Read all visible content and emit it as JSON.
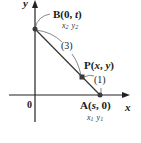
{
  "diagram": {
    "axes": {
      "x_label": "x",
      "y_label": "y",
      "origin_label": "0"
    },
    "points": {
      "B": {
        "name": "B",
        "coords": "(0, t)",
        "x_text": "0",
        "y_text": "t",
        "annotation": "x₂ y₂",
        "ann_x": "x",
        "ann_x_sub": "2",
        "ann_y": "y",
        "ann_y_sub": "2"
      },
      "P": {
        "name": "P",
        "coords": "(x, y)",
        "x_text": "x",
        "y_text": "y"
      },
      "A": {
        "name": "A",
        "coords": "(s, 0)",
        "x_text": "s",
        "y_text": "0",
        "annotation": "x₁ y₁",
        "ann_x": "x",
        "ann_x_sub": "1",
        "ann_y": "y",
        "ann_y_sub": "1"
      }
    },
    "ratio_labels": {
      "BP": "(3)",
      "PA": "(1)"
    },
    "colors": {
      "ink": "#1a1a1a",
      "point": "#3a3a3a",
      "line": "#333333"
    }
  }
}
